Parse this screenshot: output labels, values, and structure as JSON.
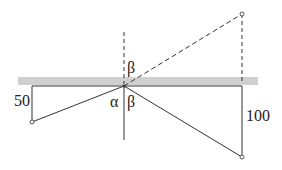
{
  "diagram": {
    "type": "reflection-geometry",
    "labels": {
      "left_height": "50",
      "right_height": "100",
      "alpha": "α",
      "beta_top": "β",
      "beta_bottom": "β"
    },
    "colors": {
      "surface_band": "#d0d0d0",
      "line": "#333333"
    }
  }
}
